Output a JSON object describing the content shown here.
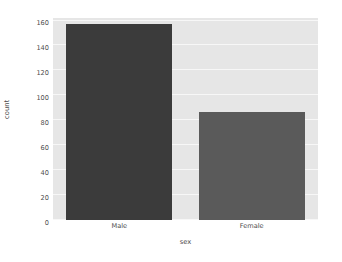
{
  "figure": {
    "background_color": "#ffffff",
    "axes_background_color": "#e6e6e6",
    "grid_color": "#f7f7f7",
    "tick_label_color": "#4d4d4d"
  },
  "chart_data": {
    "type": "bar",
    "title": "",
    "xlabel": "sex",
    "ylabel": "count",
    "categories": [
      "Male",
      "Female"
    ],
    "values": [
      157,
      87
    ],
    "bar_colors": [
      "#3b3b3b",
      "#5a5a5a"
    ],
    "ylim": [
      0,
      162
    ],
    "yticks": [
      0,
      20,
      40,
      60,
      80,
      100,
      120,
      140,
      160
    ],
    "ytick_labels": [
      "0",
      "20",
      "40",
      "60",
      "80",
      "100",
      "120",
      "140",
      "160"
    ],
    "xtick_labels": [
      "Male",
      "Female"
    ],
    "grid": true,
    "grid_axis": "y",
    "legend": null,
    "legend_position": "none",
    "style": "seaborn-darkgrid"
  }
}
